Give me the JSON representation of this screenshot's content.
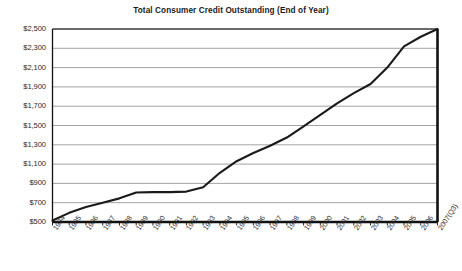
{
  "chart_data": {
    "type": "line",
    "title": "Total Consumer Credit Outstanding (End of Year)",
    "xlabel": "",
    "ylabel": "",
    "ylim": [
      500,
      2500
    ],
    "ytick_values": [
      500,
      700,
      900,
      1100,
      1300,
      1500,
      1700,
      1900,
      2100,
      2300,
      2500
    ],
    "ytick_labels": [
      "$500",
      "$700",
      "$900",
      "$1,100",
      "$1,300",
      "$1,500",
      "$1,700",
      "$1,900",
      "$2,100",
      "$2,300",
      "$2,500"
    ],
    "grid": true,
    "legend": "none",
    "categories": [
      "1984",
      "1985",
      "1986",
      "1987",
      "1988",
      "1989",
      "1990",
      "1991",
      "1992",
      "1993",
      "1994",
      "1995",
      "1996",
      "1997",
      "1998",
      "1999",
      "2000",
      "2001",
      "2002",
      "2003",
      "2004",
      "2005",
      "2006",
      "2007(Q3)"
    ],
    "series": [
      {
        "name": "Total Consumer Credit Outstanding",
        "values": [
          515,
          595,
          655,
          700,
          745,
          805,
          810,
          810,
          815,
          860,
          1010,
          1130,
          1215,
          1290,
          1375,
          1490,
          1610,
          1730,
          1835,
          1930,
          2100,
          2320,
          2420,
          2500
        ]
      }
    ],
    "units": "Billions of dollars",
    "line_color": "#1a1a1a"
  },
  "axes": {
    "frame_color": "#111111",
    "gridline_color": "#8c8c8c",
    "background": "#ffffff"
  }
}
